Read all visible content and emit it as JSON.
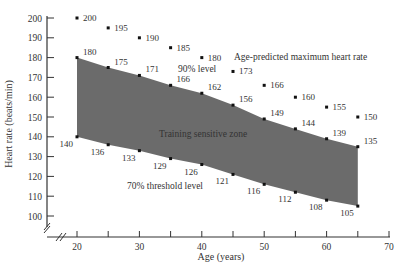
{
  "chart_data": {
    "type": "area",
    "title": "",
    "xlabel": "Age (years)",
    "ylabel": "Heart rate (beats/min)",
    "xlim": [
      20,
      70
    ],
    "ylim": [
      100,
      200
    ],
    "x_ticks": [
      20,
      25,
      30,
      35,
      40,
      45,
      50,
      55,
      60,
      65,
      70
    ],
    "x_tick_labels": [
      "20",
      "30",
      "40",
      "50",
      "60",
      "70"
    ],
    "y_ticks": [
      100,
      110,
      120,
      130,
      140,
      150,
      160,
      170,
      180,
      190,
      200
    ],
    "grid": false,
    "x": [
      20,
      25,
      30,
      35,
      40,
      45,
      50,
      55,
      60,
      65
    ],
    "series": [
      {
        "name": "Age-predicted maximum heart rate",
        "values": [
          200,
          195,
          190,
          185,
          180,
          173,
          166,
          160,
          155,
          150
        ]
      },
      {
        "name": "90% level",
        "values": [
          180,
          175,
          171,
          166,
          162,
          156,
          149,
          144,
          139,
          135
        ]
      },
      {
        "name": "70% threshold level",
        "values": [
          140,
          136,
          133,
          129,
          126,
          121,
          116,
          112,
          108,
          105
        ]
      }
    ],
    "annotations": [
      "Age-predicted maximum heart rate",
      "90% level",
      "Training sensitive zone",
      "70% threshold level"
    ],
    "shaded_region": {
      "label": "Training sensitive zone",
      "between": [
        "90% level",
        "70% threshold level"
      ],
      "color": "#666666"
    }
  },
  "labels": {
    "xlabel": "Age (years)",
    "ylabel": "Heart rate (beats/min)",
    "max_label": "Age-predicted maximum heart rate",
    "ninety_label": "90% level",
    "zone_label": "Training sensitive zone",
    "seventy_label": "70% threshold level"
  }
}
